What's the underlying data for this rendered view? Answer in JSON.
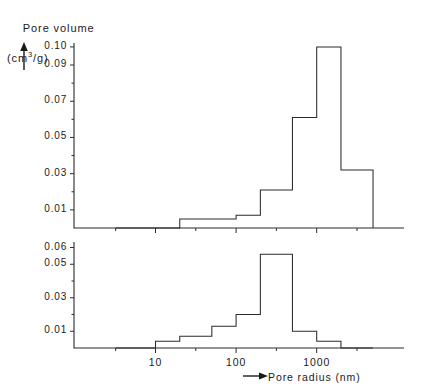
{
  "figure": {
    "y_axis_title_line1": "Pore volume",
    "y_axis_title_line2_pre": "(cm",
    "y_axis_title_line2_sup": "3",
    "y_axis_title_line2_post": "/g)",
    "x_axis_title": "Pore radius (nm)",
    "up_arrow_icon": "up-arrow-icon",
    "right_arrow_icon": "right-arrow-icon"
  },
  "chart_data": [
    {
      "type": "bar",
      "id": "top-panel",
      "title": "",
      "xlabel": "Pore radius (nm)",
      "ylabel": "Pore volume (cm3/g)",
      "xscale": "log",
      "xlim": [
        3.2,
        10000
      ],
      "ylim": [
        0,
        0.105
      ],
      "grid": false,
      "legend": "none",
      "ytick_labels": [
        "0.01",
        "0.03",
        "0.05",
        "0.07",
        "0.09",
        "0.10"
      ],
      "ytick_values": [
        0.01,
        0.03,
        0.05,
        0.07,
        0.09,
        0.1
      ],
      "yminor_values": [
        0.02,
        0.04,
        0.06,
        0.08
      ],
      "xtick_labels": [
        "10",
        "100",
        "1000"
      ],
      "xtick_values": [
        10,
        100,
        1000
      ],
      "xminor_values": [
        3.2,
        31.6,
        316,
        3162
      ],
      "bin_edges": [
        3.2,
        10,
        20,
        50,
        100,
        200,
        500,
        1000,
        2000,
        5000
      ],
      "values": [
        0,
        0.005,
        0.005,
        0.007,
        0.021,
        0.061,
        0.1,
        0.032,
        0
      ],
      "bars": [
        {
          "left": 3.2,
          "right": 10,
          "value": 0
        },
        {
          "left": 10,
          "right": 20,
          "value": 0
        },
        {
          "left": 20,
          "right": 50,
          "value": 0.005
        },
        {
          "left": 50,
          "right": 100,
          "value": 0.005
        },
        {
          "left": 100,
          "right": 200,
          "value": 0.007
        },
        {
          "left": 200,
          "right": 500,
          "value": 0.021
        },
        {
          "left": 500,
          "right": 1000,
          "value": 0.061
        },
        {
          "left": 1000,
          "right": 2000,
          "value": 0.1
        },
        {
          "left": 2000,
          "right": 5000,
          "value": 0.032
        }
      ]
    },
    {
      "type": "bar",
      "id": "bottom-panel",
      "title": "",
      "xlabel": "Pore radius (nm)",
      "ylabel": "Pore volume (cm3/g)",
      "xscale": "log",
      "xlim": [
        3.2,
        10000
      ],
      "ylim": [
        0,
        0.062
      ],
      "grid": false,
      "legend": "none",
      "ytick_labels": [
        "0.01",
        "0.03",
        "0.05",
        "0.06"
      ],
      "ytick_values": [
        0.01,
        0.03,
        0.05,
        0.06
      ],
      "yminor_values": [
        0.02,
        0.04
      ],
      "xtick_labels": [
        "10",
        "100",
        "1000"
      ],
      "xtick_values": [
        10,
        100,
        1000
      ],
      "xminor_values": [
        3.2,
        31.6,
        316,
        3162
      ],
      "bin_edges": [
        3.2,
        10,
        20,
        50,
        100,
        200,
        500,
        1000,
        2000,
        5000
      ],
      "values": [
        0,
        0.004,
        0.007,
        0.013,
        0.02,
        0.056,
        0.01,
        0.004,
        0
      ],
      "bars": [
        {
          "left": 3.2,
          "right": 10,
          "value": 0
        },
        {
          "left": 10,
          "right": 20,
          "value": 0.004
        },
        {
          "left": 20,
          "right": 50,
          "value": 0.007
        },
        {
          "left": 50,
          "right": 100,
          "value": 0.013
        },
        {
          "left": 100,
          "right": 200,
          "value": 0.02
        },
        {
          "left": 200,
          "right": 500,
          "value": 0.056
        },
        {
          "left": 500,
          "right": 1000,
          "value": 0.01
        },
        {
          "left": 1000,
          "right": 2000,
          "value": 0.004
        },
        {
          "left": 2000,
          "right": 5000,
          "value": 0
        }
      ]
    }
  ],
  "colors": {
    "ink": "#2b2b2b",
    "text": "#1a1a1a",
    "background": "#ffffff"
  }
}
